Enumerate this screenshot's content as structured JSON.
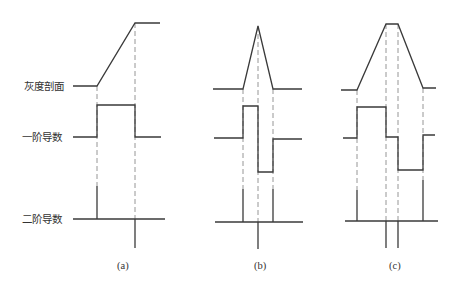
{
  "diagram": {
    "row_labels": {
      "profile": "灰度剖面",
      "first_derivative": "一阶导数",
      "second_derivative": "二阶导数"
    },
    "panels": [
      {
        "id": "a",
        "label": "(a)",
        "description": "ramp edge",
        "profile": [
          [
            73,
            86
          ],
          [
            97,
            86
          ],
          [
            135,
            23
          ],
          [
            160,
            23
          ]
        ],
        "first_derivative": [
          [
            73,
            137
          ],
          [
            97,
            137
          ],
          [
            97,
            105
          ],
          [
            135,
            105
          ],
          [
            135,
            137
          ],
          [
            161,
            137
          ]
        ],
        "second_derivative_baseline": [
          73,
          165,
          219
        ],
        "second_derivative_spikes": [
          [
            97,
            186,
            219
          ],
          [
            135,
            219,
            248
          ]
        ],
        "dashed_guides": [
          [
            97,
            86,
            186
          ],
          [
            135,
            23,
            219
          ]
        ]
      },
      {
        "id": "b",
        "label": "(b)",
        "description": "roof / peak edge",
        "profile": [
          [
            213,
            89
          ],
          [
            243,
            89
          ],
          [
            258,
            26
          ],
          [
            273,
            89
          ],
          [
            302,
            89
          ]
        ],
        "first_derivative": [
          [
            214,
            138
          ],
          [
            243,
            138
          ],
          [
            243,
            106
          ],
          [
            258,
            106
          ],
          [
            258,
            172
          ],
          [
            273,
            172
          ],
          [
            273,
            139
          ],
          [
            302,
            139
          ]
        ],
        "second_derivative_baseline": [
          215,
          303,
          222
        ],
        "second_derivative_spikes": [
          [
            243,
            189,
            222
          ],
          [
            258,
            222,
            249
          ],
          [
            273,
            189,
            222
          ]
        ],
        "dashed_guides": [
          [
            243,
            89,
            189
          ],
          [
            258,
            26,
            222
          ],
          [
            273,
            89,
            189
          ]
        ]
      },
      {
        "id": "c",
        "label": "(c)",
        "description": "trapezoid edge",
        "profile": [
          [
            341,
            90
          ],
          [
            357,
            90
          ],
          [
            386,
            24
          ],
          [
            398,
            24
          ],
          [
            423,
            88
          ],
          [
            436,
            88
          ]
        ],
        "first_derivative": [
          [
            343,
            138
          ],
          [
            357,
            138
          ],
          [
            357,
            107
          ],
          [
            386,
            107
          ],
          [
            386,
            137
          ],
          [
            398,
            137
          ],
          [
            398,
            170
          ],
          [
            423,
            170
          ],
          [
            423,
            135
          ],
          [
            435,
            135
          ]
        ],
        "second_derivative_baseline": [
          345,
          438,
          221
        ],
        "second_derivative_spikes": [
          [
            357,
            190,
            221
          ],
          [
            386,
            221,
            248
          ],
          [
            398,
            221,
            248
          ],
          [
            423,
            180,
            221
          ]
        ],
        "dashed_guides": [
          [
            357,
            90,
            190
          ],
          [
            386,
            24,
            221
          ],
          [
            398,
            24,
            221
          ],
          [
            423,
            88,
            180
          ]
        ]
      }
    ]
  }
}
